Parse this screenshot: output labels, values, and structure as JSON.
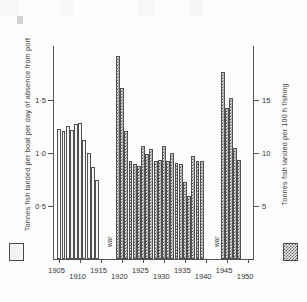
{
  "chart_data": {
    "type": "bar",
    "title": "",
    "subtitle": "",
    "xlabel": "",
    "ylabel": "Tonnes fish landed per boat per day of absence from port",
    "ylabel_right": "Tonnes fish landed per 100 h fishing",
    "grid": false,
    "legend_position": "outside-bottom-corners",
    "x_ticks": [
      "1905",
      "1910",
      "1915",
      "1920",
      "1925",
      "1930",
      "1935",
      "1940",
      "1945",
      "1950"
    ],
    "y_ticks_left": [
      "0·5",
      "1·0",
      "1·5"
    ],
    "y_ticks_right": [
      "5",
      "10",
      "15"
    ],
    "ylim_left": [
      0,
      2.0
    ],
    "ylim_right": [
      0,
      20
    ],
    "xlim": [
      1903.5,
      1951.5
    ],
    "annotations": [
      {
        "text": "war",
        "x_start": 1915,
        "x_end": 1918
      },
      {
        "text": "war",
        "x_start": 1940,
        "x_end": 1943
      }
    ],
    "legend": [
      {
        "swatch": "plain",
        "label": "Tonnes fish landed per boat per day of absence from port",
        "axis": "left"
      },
      {
        "swatch": "hatched",
        "label": "Tonnes fish landed per 100 h fishing",
        "axis": "right"
      }
    ],
    "series": [
      {
        "name": "Tonnes fish landed per boat per day of absence from port",
        "swatch": "plain",
        "axis": "left",
        "x": [
          1905,
          1906,
          1907,
          1908,
          1909,
          1910,
          1911,
          1912,
          1913,
          1914
        ],
        "values": [
          1.22,
          1.2,
          1.25,
          1.21,
          1.27,
          1.28,
          1.12,
          1.0,
          0.86,
          0.74
        ]
      },
      {
        "name": "Tonnes fish landed per 100 h fishing",
        "swatch": "hatched",
        "axis": "right",
        "x": [
          1919,
          1920,
          1921,
          1922,
          1923,
          1924,
          1925,
          1926,
          1927,
          1928,
          1929,
          1930,
          1931,
          1932,
          1933,
          1934,
          1935,
          1936,
          1937,
          1938,
          1939,
          1944,
          1945,
          1946,
          1947,
          1948
        ],
        "values": [
          19.1,
          16.1,
          12.0,
          9.2,
          8.9,
          8.7,
          10.6,
          9.9,
          10.3,
          9.2,
          9.3,
          10.6,
          9.2,
          10.0,
          9.0,
          8.9,
          7.2,
          5.9,
          9.7,
          9.2,
          9.2,
          17.6,
          14.2,
          15.1,
          10.4,
          9.3
        ]
      }
    ]
  },
  "legend": {
    "plain_swatch_name": "open-bar-swatch",
    "hatched_swatch_name": "hatched-bar-swatch"
  }
}
